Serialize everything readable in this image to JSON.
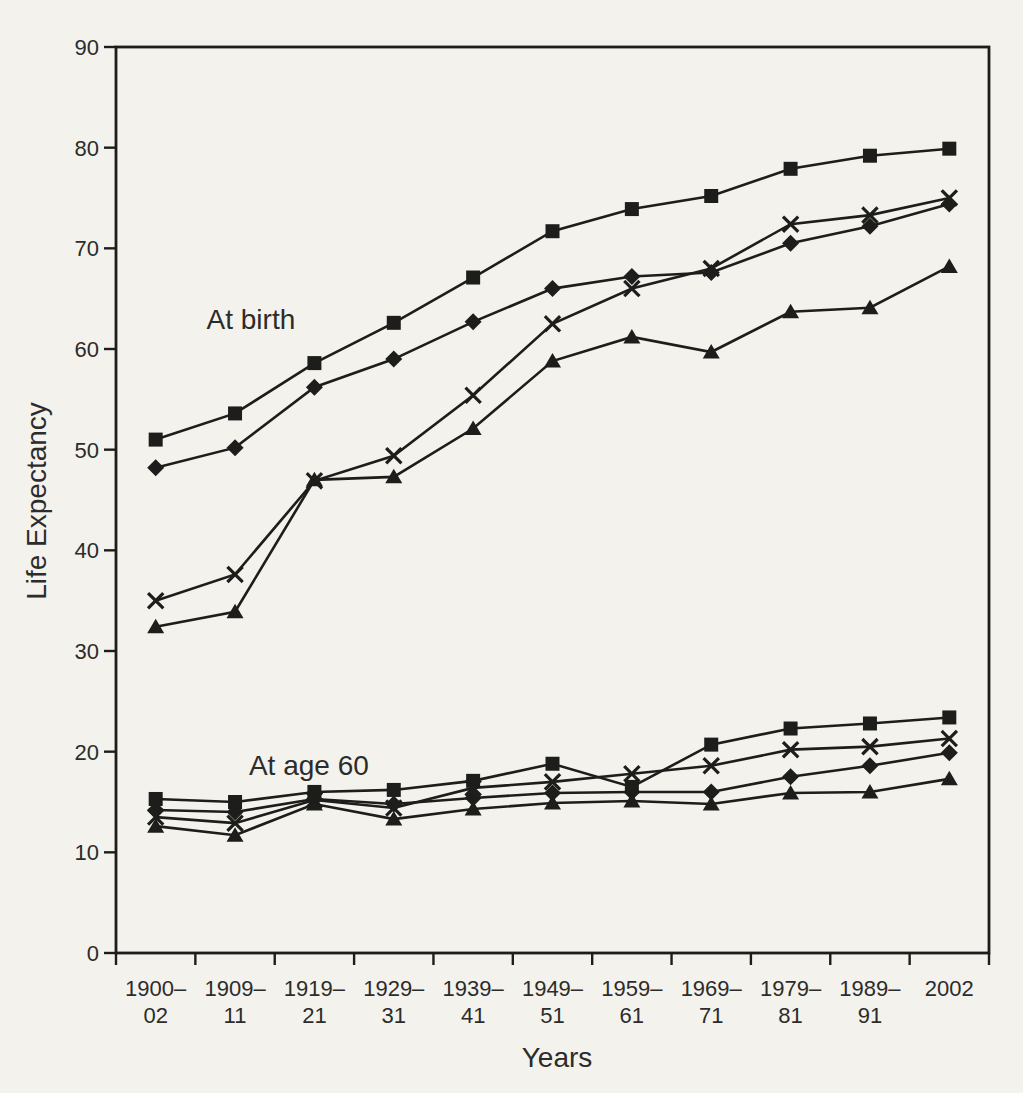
{
  "colors": {
    "ink": "#1d1d1b",
    "text": "#2c2c2a",
    "paper": "#f4f2ed"
  },
  "chart_data": {
    "type": "line",
    "title": "",
    "xlabel": "Years",
    "ylabel": "Life Expectancy",
    "ylim": [
      0,
      90
    ],
    "yticks": [
      0,
      10,
      20,
      30,
      40,
      50,
      60,
      70,
      80,
      90
    ],
    "grid": false,
    "legend": "none",
    "line_color": "#1d1d1b",
    "categories": [
      "1900–02",
      "1909–11",
      "1919–21",
      "1929–31",
      "1939–41",
      "1949–51",
      "1959–61",
      "1969–71",
      "1979–81",
      "1989–91",
      "2002"
    ],
    "category_tick_lines": [
      [
        "1900–",
        "02"
      ],
      [
        "1909–",
        "11"
      ],
      [
        "1919–",
        "21"
      ],
      [
        "1929–",
        "31"
      ],
      [
        "1939–",
        "41"
      ],
      [
        "1949–",
        "51"
      ],
      [
        "1959–",
        "61"
      ],
      [
        "1969–",
        "71"
      ],
      [
        "1979–",
        "81"
      ],
      [
        "1989–",
        "91"
      ],
      [
        "2002",
        ""
      ]
    ],
    "annotations": [
      {
        "text": "At birth",
        "cx": 1.2,
        "cy": 63.0
      },
      {
        "text": "At age 60",
        "cx": 1.93,
        "cy": 18.7
      }
    ],
    "series": [
      {
        "group": "At birth",
        "marker": "square",
        "values": [
          51.0,
          53.6,
          58.6,
          62.6,
          67.1,
          71.7,
          73.9,
          75.2,
          77.9,
          79.2,
          79.9
        ]
      },
      {
        "group": "At birth",
        "marker": "diamond",
        "values": [
          48.2,
          50.2,
          56.2,
          59.0,
          62.7,
          66.0,
          67.2,
          67.6,
          70.5,
          72.2,
          74.4
        ]
      },
      {
        "group": "At birth",
        "marker": "x",
        "values": [
          35.0,
          37.6,
          46.9,
          49.4,
          55.4,
          62.5,
          66.0,
          68.0,
          72.4,
          73.3,
          75.0
        ]
      },
      {
        "group": "At birth",
        "marker": "triangle",
        "values": [
          32.4,
          33.9,
          47.0,
          47.3,
          52.1,
          58.8,
          61.2,
          59.7,
          63.7,
          64.1,
          68.2
        ]
      },
      {
        "group": "At age 60",
        "marker": "square",
        "values": [
          15.3,
          15.0,
          16.0,
          16.2,
          17.1,
          18.8,
          16.5,
          20.7,
          22.3,
          22.8,
          23.4
        ]
      },
      {
        "group": "At age 60",
        "marker": "diamond",
        "values": [
          14.2,
          14.0,
          15.3,
          14.8,
          15.4,
          15.9,
          16.0,
          16.0,
          17.5,
          18.6,
          19.9
        ]
      },
      {
        "group": "At age 60",
        "marker": "x",
        "values": [
          13.5,
          12.9,
          15.2,
          14.4,
          16.4,
          17.0,
          17.8,
          18.6,
          20.2,
          20.5,
          21.3
        ]
      },
      {
        "group": "At age 60",
        "marker": "triangle",
        "values": [
          12.6,
          11.7,
          14.8,
          13.3,
          14.3,
          14.9,
          15.1,
          14.8,
          15.9,
          16.0,
          17.3
        ]
      }
    ]
  }
}
